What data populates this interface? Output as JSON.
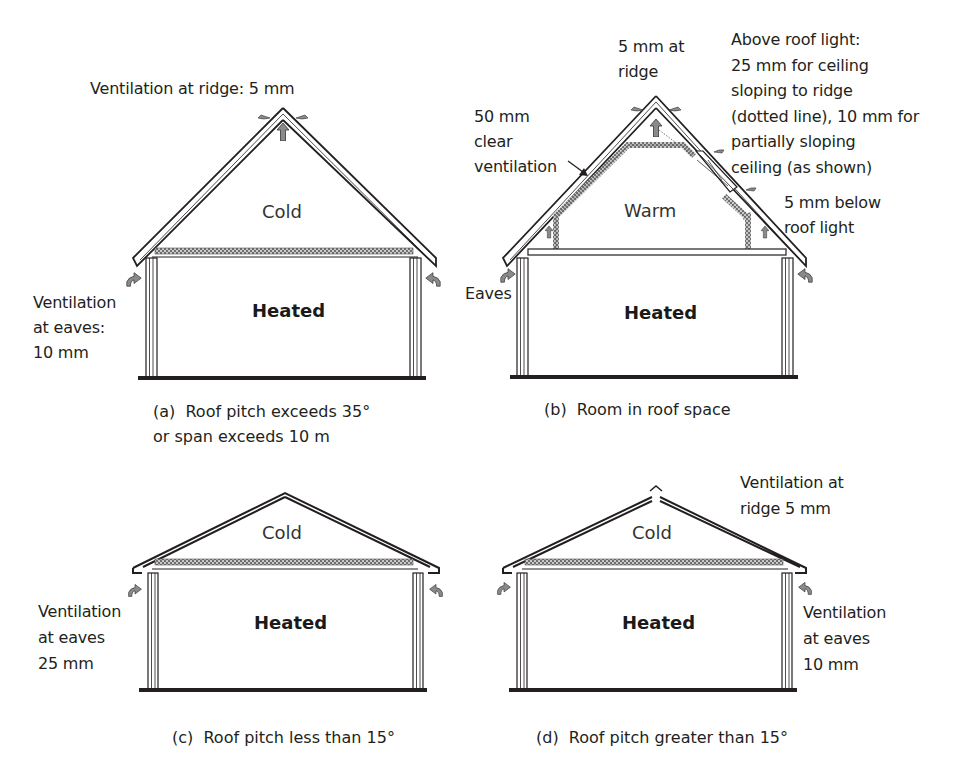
{
  "panels": [
    {
      "id": "a",
      "caption": "(a)  Roof pitch exceeds 35°\nor span exceeds 10 m",
      "upper_zone": "Cold",
      "lower_zone": "Heated",
      "annotations": {
        "ridge": "Ventilation at ridge: 5 mm",
        "eaves": "Ventilation\nat eaves:\n10 mm"
      }
    },
    {
      "id": "b",
      "caption": "(b)  Room in roof space",
      "upper_zone": "Warm",
      "lower_zone": "Heated",
      "annotations": {
        "ridge": "5 mm at\nridge",
        "clear_ventilation": "50 mm\nclear\nventilation",
        "roof_light_above": "Above roof light:\n25 mm for ceiling\nsloping to ridge\n(dotted line), 10 mm for\npartially sloping\nceiling (as shown)",
        "roof_light_below": "5 mm below\nroof light",
        "eaves": "Eaves"
      }
    },
    {
      "id": "c",
      "caption": "(c)  Roof pitch less than 15°",
      "upper_zone": "Cold",
      "lower_zone": "Heated",
      "annotations": {
        "eaves": "Ventilation\nat eaves\n25 mm"
      }
    },
    {
      "id": "d",
      "caption": "(d)  Roof pitch greater than 15°",
      "upper_zone": "Cold",
      "lower_zone": "Heated",
      "annotations": {
        "ridge": "Ventilation at\nridge 5 mm",
        "eaves": "Ventilation\nat eaves\n10 mm"
      }
    }
  ],
  "colors": {
    "line": "#231f20",
    "arrow_fill": "#8a8a8a",
    "insulation": "#9a9a9a"
  }
}
